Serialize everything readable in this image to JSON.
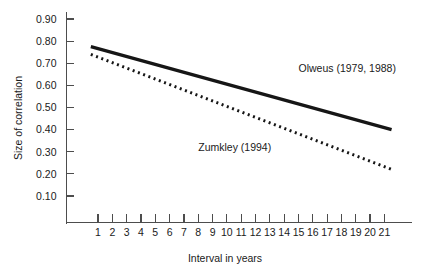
{
  "chart_data": {
    "type": "line",
    "title": "",
    "xlabel": "Interval in years",
    "ylabel": "Size of correlation",
    "xlim": [
      0,
      22
    ],
    "ylim": [
      0,
      0.95
    ],
    "grid": false,
    "legend_position": "inline-annotation",
    "x_tick_labels": [
      "1",
      "2",
      "3",
      "4",
      "5",
      "6",
      "7",
      "8",
      "9",
      "10",
      "11",
      "12",
      "13",
      "14",
      "15",
      "16",
      "17",
      "18",
      "19",
      "20",
      "21"
    ],
    "x_tick_values": [
      1,
      2,
      3,
      4,
      5,
      6,
      7,
      8,
      9,
      10,
      11,
      12,
      13,
      14,
      15,
      16,
      17,
      18,
      19,
      20,
      21
    ],
    "y_tick_labels": [
      "0.90",
      "0.80",
      "0.70",
      "0.60",
      "0.50",
      "0.40",
      "0.30",
      "0.20",
      "0.10"
    ],
    "y_tick_values": [
      0.9,
      0.8,
      0.7,
      0.6,
      0.5,
      0.4,
      0.3,
      0.2,
      0.1
    ],
    "series": [
      {
        "name": "Olweus (1979, 1988)",
        "style": "solid",
        "color": "#161616",
        "x": [
          0.5,
          21.5
        ],
        "values": [
          0.775,
          0.4
        ],
        "label_position": {
          "x": 15.0,
          "y": 0.66
        }
      },
      {
        "name": "Zumkley (1994)",
        "style": "dotted",
        "color": "#161616",
        "x": [
          0.5,
          21.5
        ],
        "values": [
          0.74,
          0.22
        ],
        "label_position": {
          "x": 8.0,
          "y": 0.305
        }
      }
    ],
    "annotations": [
      {
        "text": "Olweus (1979, 1988)",
        "series": "Olweus (1979, 1988)"
      },
      {
        "text": "Zumkley (1994)",
        "series": "Zumkley (1994)"
      }
    ]
  },
  "axes": {
    "y_axis_title": "Size of correlation",
    "x_axis_title": "Interval in years"
  },
  "colors": {
    "axis": "#4d4d4d",
    "line": "#161616",
    "text": "#1a1a1a",
    "background": "#ffffff"
  }
}
